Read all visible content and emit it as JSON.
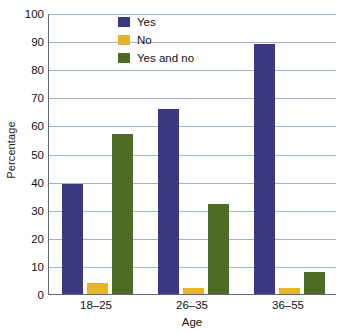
{
  "chart_data": {
    "type": "bar",
    "title": "",
    "xlabel": "Age",
    "ylabel": "Percentage",
    "categories": [
      "18–25",
      "26–35",
      "36–55"
    ],
    "series": [
      {
        "name": "Yes",
        "color": "#3b3780",
        "values": [
          39,
          66,
          89
        ]
      },
      {
        "name": "No",
        "color": "#e6b32a",
        "values": [
          4,
          2,
          2
        ]
      },
      {
        "name": "Yes and no",
        "color": "#4e6b24",
        "values": [
          57,
          32,
          8
        ]
      }
    ],
    "ylim": [
      0,
      100
    ],
    "ytick_step": 10,
    "ytick_labels": [
      "0",
      "10",
      "20",
      "30",
      "40",
      "50",
      "60",
      "70",
      "80",
      "90",
      "100"
    ],
    "grid": true,
    "grid_axis": "y",
    "legend_position": "top-center-left",
    "background_color": "#ffffff",
    "grid_color": "#9fb4c6",
    "axis_color": "#5d6b78"
  },
  "axes": {
    "y_title": "Percentage",
    "x_title": "Age"
  },
  "legend": {
    "items": [
      {
        "label": "Yes"
      },
      {
        "label": "No"
      },
      {
        "label": "Yes and no"
      }
    ]
  }
}
